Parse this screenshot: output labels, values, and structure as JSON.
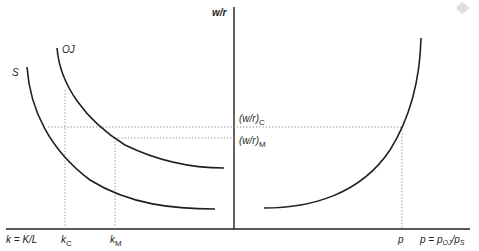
{
  "diagram": {
    "axes": {
      "vertical_label": "w/r",
      "horizontal_left_label": "k = K/L",
      "horizontal_right_label_prefix": "p = p",
      "horizontal_right_sub1": "OJ",
      "horizontal_right_mid": "/p",
      "horizontal_right_sub2": "S"
    },
    "curves": {
      "oj": {
        "label": "OJ"
      },
      "s": {
        "label": "S"
      }
    },
    "markers": {
      "k_c": {
        "base": "k",
        "sub": "C"
      },
      "k_m": {
        "base": "k",
        "sub": "M"
      },
      "p": {
        "label": "p"
      },
      "wr_c": {
        "base": "(w/r)",
        "sub": "C"
      },
      "wr_m": {
        "base": "(w/r)",
        "sub": "M"
      }
    },
    "colors": {
      "ink": "#231f20",
      "guide": "#8a8a8a"
    }
  }
}
